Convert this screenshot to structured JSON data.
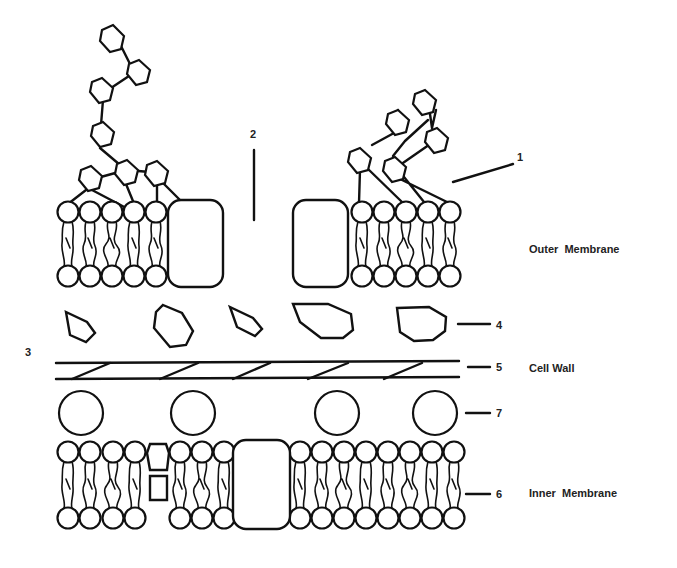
{
  "diagram": {
    "type": "gram-negative-cell-envelope",
    "colors": {
      "ink": "#111111",
      "background": "#ffffff",
      "label_text": "#222222"
    },
    "region_labels": [
      {
        "id": "outer-membrane",
        "text": "Outer  Membrane",
        "x": 529,
        "y": 253
      },
      {
        "id": "cell-wall",
        "text": "Cell Wall",
        "x": 529,
        "y": 372
      },
      {
        "id": "inner-membrane",
        "text": "Inner  Membrane",
        "x": 529,
        "y": 497
      }
    ],
    "callouts": [
      {
        "number": "1",
        "target": "lipopolysaccharide",
        "line": [
          453,
          182,
          513,
          164
        ],
        "text_x": 517,
        "text_y": 161
      },
      {
        "number": "2",
        "target": "porin-channel",
        "line": [
          254,
          150,
          254,
          220
        ],
        "text_x": 250,
        "text_y": 138
      },
      {
        "number": "3",
        "target": "periplasmic-space",
        "line": null,
        "text_x": 25,
        "text_y": 356
      },
      {
        "number": "4",
        "target": "periplasmic-protein",
        "line": [
          458,
          324,
          490,
          324
        ],
        "text_x": 496,
        "text_y": 329
      },
      {
        "number": "5",
        "target": "peptidoglycan",
        "line": [
          468,
          367,
          490,
          367
        ],
        "text_x": 496,
        "text_y": 371
      },
      {
        "number": "6",
        "target": "phospholipid-bilayer",
        "line": [
          466,
          494,
          490,
          494
        ],
        "text_x": 496,
        "text_y": 498
      },
      {
        "number": "7",
        "target": "lipoprotein",
        "line": [
          466,
          413,
          490,
          413
        ],
        "text_x": 496,
        "text_y": 417
      }
    ]
  }
}
